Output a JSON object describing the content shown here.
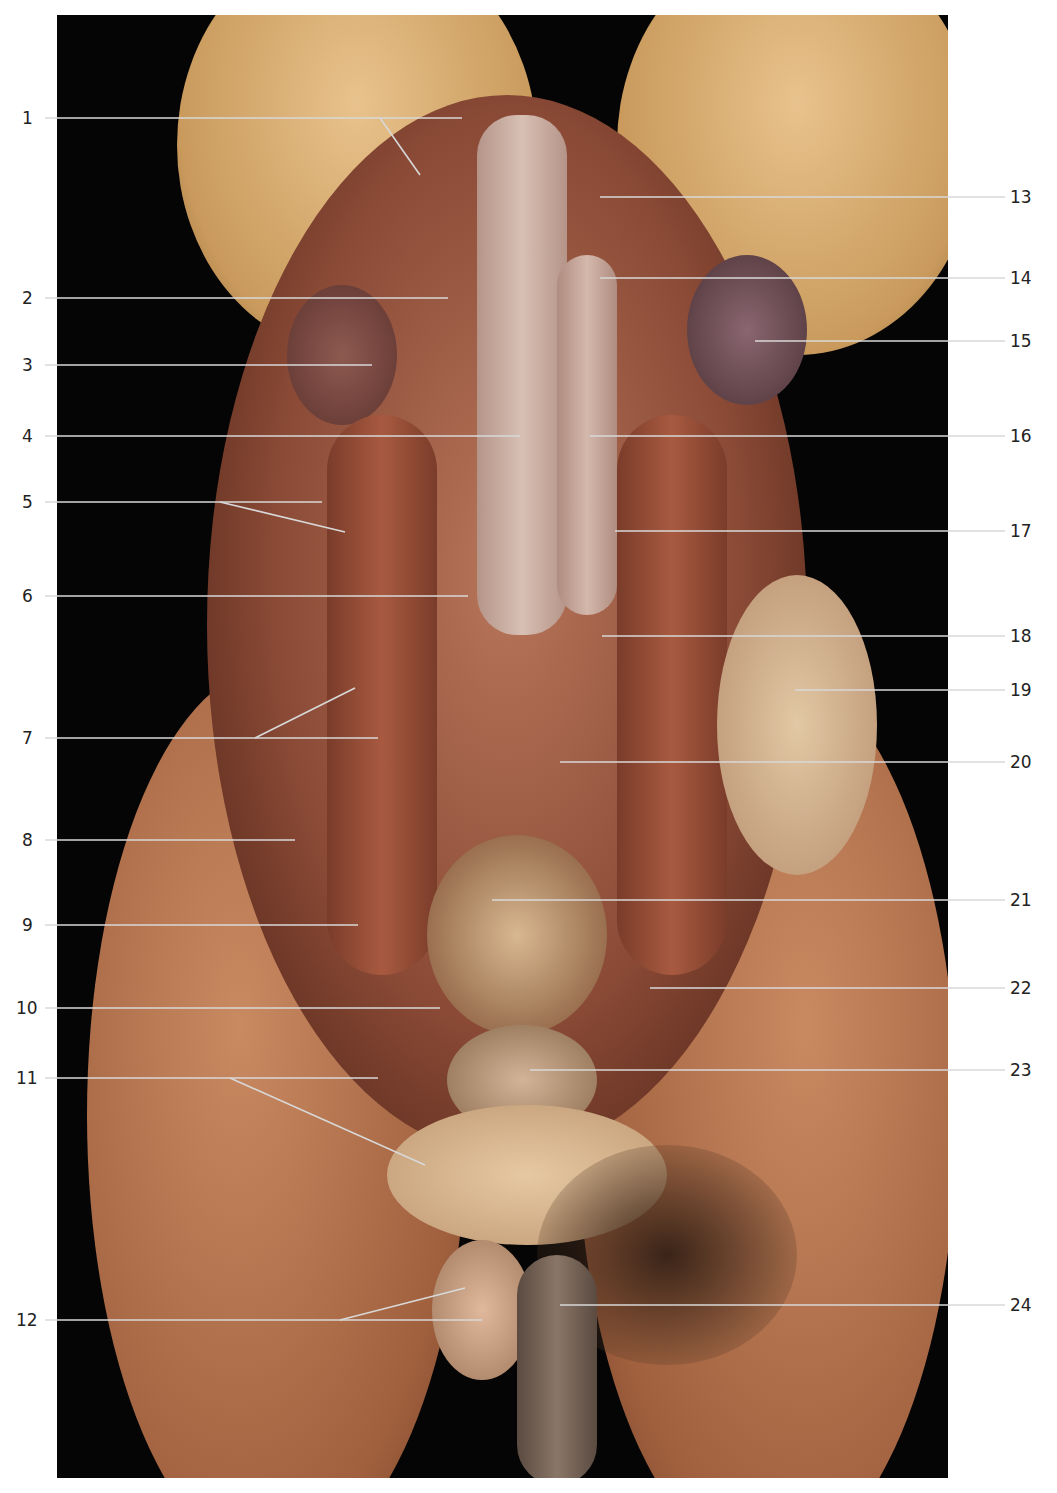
{
  "figure": {
    "labels_left": [
      {
        "n": "1"
      },
      {
        "n": "2"
      },
      {
        "n": "3"
      },
      {
        "n": "4"
      },
      {
        "n": "5"
      },
      {
        "n": "6"
      },
      {
        "n": "7"
      },
      {
        "n": "8"
      },
      {
        "n": "9"
      },
      {
        "n": "10"
      },
      {
        "n": "11"
      },
      {
        "n": "12"
      }
    ],
    "labels_right": [
      {
        "n": "13"
      },
      {
        "n": "14"
      },
      {
        "n": "15"
      },
      {
        "n": "16"
      },
      {
        "n": "17"
      },
      {
        "n": "18"
      },
      {
        "n": "19"
      },
      {
        "n": "20"
      },
      {
        "n": "21"
      },
      {
        "n": "22"
      },
      {
        "n": "23"
      },
      {
        "n": "24"
      }
    ]
  }
}
